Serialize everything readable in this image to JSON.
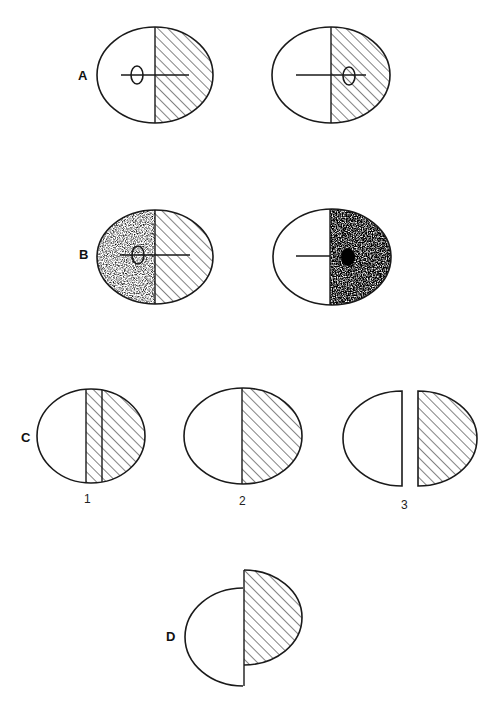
{
  "diagram": {
    "rows": [
      {
        "id": "A",
        "label": "A",
        "items": [
          {
            "description": "egg, left half blank, right half hatched, spindle axis with oocyte on left"
          },
          {
            "description": "egg, left half blank, right half hatched, spindle axis with oocyte on right"
          }
        ]
      },
      {
        "id": "B",
        "label": "B",
        "items": [
          {
            "description": "egg, left half stippled, right half hatched, oocyte on left"
          },
          {
            "description": "egg, left half blank, right half dark stippled with black nucleus"
          }
        ]
      },
      {
        "id": "C",
        "label": "C",
        "items": [
          {
            "number": "1",
            "description": "egg with hatched band left of midline"
          },
          {
            "number": "2",
            "description": "egg divided at midline, right hatched"
          },
          {
            "number": "3",
            "description": "two separated halves, right hatched"
          }
        ]
      },
      {
        "id": "D",
        "label": "D",
        "items": [
          {
            "description": "two offset halves joined at midline, right hatched"
          }
        ]
      }
    ],
    "colors": {
      "stroke": "#1a1a1a",
      "background": "#ffffff"
    }
  }
}
